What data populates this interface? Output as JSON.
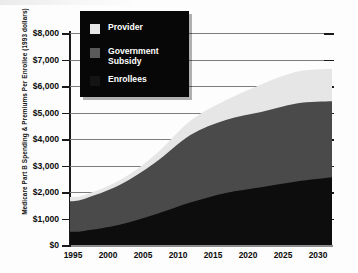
{
  "chart_data": {
    "type": "area",
    "title": "",
    "subtitle": "",
    "xlabel": "",
    "ylabel": "Medicare Part B Spending & Premiums Per Enrollee (1993 dollars)",
    "stacked": true,
    "grid": true,
    "legend_position": "top-left-overlay",
    "xlim": [
      1993,
      2030
    ],
    "ylim": [
      0,
      8000
    ],
    "x_ticks": [
      "1995",
      "2000",
      "2005",
      "2010",
      "2015",
      "2020",
      "2025",
      "2030"
    ],
    "x_tick_values": [
      1995,
      2000,
      2005,
      2010,
      2015,
      2020,
      2025,
      2030
    ],
    "y_ticks": [
      "$0",
      "$1,000",
      "$2,000",
      "$3,000",
      "$4,000",
      "$5,000",
      "$6,000",
      "$7,000",
      "$8,000"
    ],
    "y_tick_values": [
      0,
      1000,
      2000,
      3000,
      4000,
      5000,
      6000,
      7000,
      8000
    ],
    "x": [
      1993,
      1995,
      2000,
      2005,
      2010,
      2015,
      2020,
      2025,
      2030
    ],
    "series": [
      {
        "name": "Enrollees",
        "color": "#0d0d0d",
        "values": [
          500,
          530,
          760,
          1150,
          1600,
          1960,
          2180,
          2400,
          2560
        ]
      },
      {
        "name": "Government Subsidy",
        "color": "#4a4a4a",
        "values": [
          1150,
          1210,
          1500,
          1950,
          2550,
          2760,
          2840,
          2940,
          2860
        ]
      },
      {
        "name": "Provider",
        "color": "#e6e6e6",
        "values": [
          160,
          140,
          180,
          300,
          540,
          740,
          1040,
          1200,
          1230
        ]
      }
    ],
    "cumulative_totals": [
      1810,
      1880,
      2440,
      3400,
      4690,
      5460,
      6060,
      6540,
      6650
    ]
  },
  "legend": {
    "items": [
      {
        "label": "Provider",
        "color": "#e6e6e6"
      },
      {
        "label": "Government\nSubsidy",
        "color": "#5a5a5a"
      },
      {
        "label": "Enrollees",
        "color": "#141414"
      }
    ]
  },
  "axes": {
    "y_title": "Medicare Part B Spending & Premiums Per Enrollee (1993 dollars)",
    "y_labels": [
      "$8,000",
      "$7,000",
      "$6,000",
      "$5,000",
      "$4,000",
      "$3,000",
      "$2,000",
      "$1,000",
      "$0"
    ],
    "x_labels": [
      "1995",
      "2000",
      "2005",
      "2010",
      "2015",
      "2020",
      "2025",
      "2030"
    ]
  }
}
